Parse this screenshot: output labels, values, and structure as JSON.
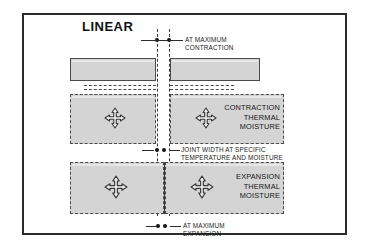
{
  "diagram": {
    "title": "LINEAR",
    "type": "joint-movement-section-diagram",
    "frame_color": "#2b2b2b",
    "block_fill": "#d4d4d4",
    "line_color": "#3a3a3a"
  },
  "callouts": {
    "top": "AT MAXIMUM\nCONTRACTION",
    "middle": "JOINT WIDTH AT SPECIFIC\nTEMPERATURE AND MOISTURE\nCONTENT OF COMPONENTS AT\nTIME OF INSTALLATION",
    "bottom": "AT MAXIMUM\nEXPANSION"
  },
  "block_labels": {
    "contraction": "CONTRACTION\nTHERMAL\nMOISTURE",
    "expansion": "EXPANSION\nTHERMAL\nMOISTURE"
  },
  "icons": {
    "movement": "four-way-arrow-icon"
  },
  "rows": [
    {
      "name": "maximum-contraction",
      "joint_state": "widest",
      "has_movement_icon": false
    },
    {
      "name": "as-installed-contraction",
      "joint_state": "specified",
      "has_movement_icon": true
    },
    {
      "name": "maximum-expansion",
      "joint_state": "narrowest",
      "has_movement_icon": true
    }
  ]
}
